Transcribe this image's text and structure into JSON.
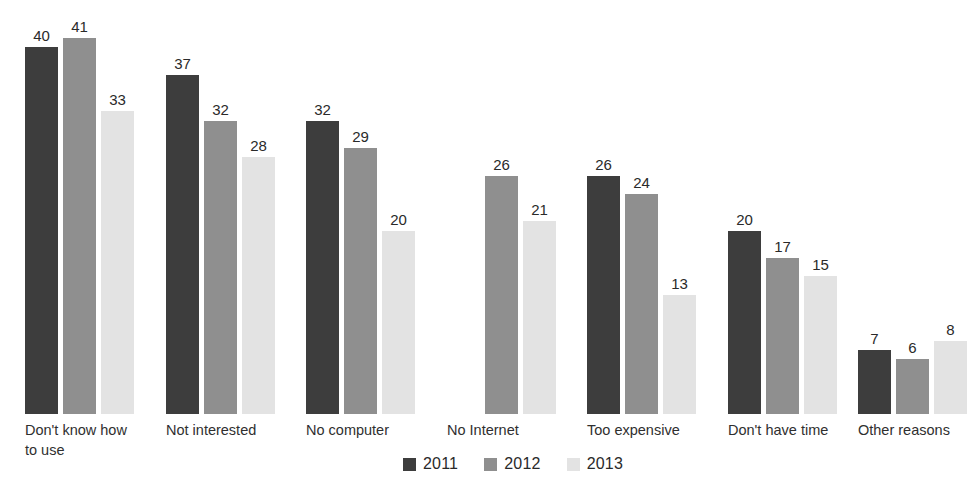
{
  "chart_data": {
    "type": "bar",
    "title": "",
    "subtitle": "",
    "xlabel": "",
    "ylabel": "",
    "ylim": [
      0,
      41
    ],
    "grid": false,
    "legend_position": "bottom-center",
    "categories": [
      "Don't know how\nto use",
      "Not interested",
      "No computer",
      "No Internet",
      "Too expensive",
      "Don't have time",
      "Other reasons"
    ],
    "series": [
      {
        "name": "2011",
        "color": "#3d3d3d",
        "values": [
          40,
          37,
          32,
          null,
          26,
          20,
          7
        ]
      },
      {
        "name": "2012",
        "color": "#8f8f8f",
        "values": [
          41,
          32,
          29,
          26,
          24,
          17,
          6
        ]
      },
      {
        "name": "2013",
        "color": "#e3e3e3",
        "values": [
          33,
          28,
          20,
          21,
          13,
          15,
          8
        ]
      }
    ],
    "data_labels": {
      "Don't know how\nto use": [
        "40",
        "41",
        "33"
      ],
      "Not interested": [
        "37",
        "32",
        "28"
      ],
      "No computer": [
        "32",
        "29",
        "20"
      ],
      "No Internet": [
        "",
        "26",
        "21"
      ],
      "Too expensive": [
        "26",
        "24",
        "13"
      ],
      "Don't have time": [
        "20",
        "17",
        "15"
      ],
      "Other reasons": [
        "7",
        "6",
        "8"
      ]
    }
  },
  "legend": {
    "items": [
      {
        "label": "2011",
        "color": "#3d3d3d"
      },
      {
        "label": "2012",
        "color": "#8f8f8f"
      },
      {
        "label": "2013",
        "color": "#e3e3e3"
      }
    ]
  },
  "layout": {
    "group_x": [
      25,
      166,
      306,
      447,
      587,
      728,
      858
    ],
    "bar_pitch": 38,
    "bar_width": 33,
    "baseline_y": 414,
    "px_per_unit": 9.17
  }
}
